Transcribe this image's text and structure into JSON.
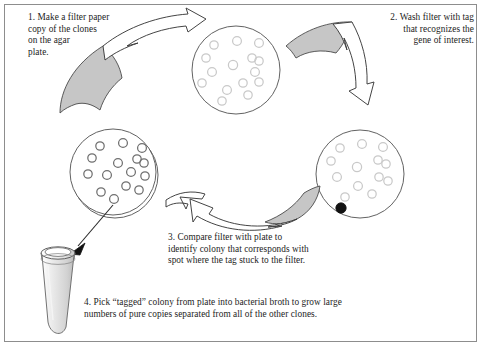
{
  "figure": {
    "frame_color": "#8d8d8d",
    "background": "#ffffff",
    "ink_color": "#2a2a2a",
    "filter_fill": "#c6c6c6",
    "colony_outline_light": "#c9c9c9",
    "colony_outline_dark": "#6f6f6f",
    "tagged_spot_color": "#111111"
  },
  "steps": [
    {
      "number": "1",
      "id": "step-1",
      "text": "1. Make a filter paper\ncopy of the clones\non the agar\nplate."
    },
    {
      "number": "2",
      "id": "step-2",
      "text": "2. Wash filter with tag\nthat recognizes the\ngene of interest."
    },
    {
      "number": "3",
      "id": "step-3",
      "text": "3. Compare filter with plate to\nidentify colony that corresponds with\nspot where the tag stuck to the filter."
    },
    {
      "number": "4",
      "id": "step-4",
      "text": "4. Pick “tagged” colony from plate into bacterial broth to grow large\nnumbers of pure copies separated from all of the other clones."
    }
  ],
  "dishes": [
    {
      "id": "filter-copy-top",
      "label": "filter paper copy with clone colonies",
      "cx": 236,
      "cy": 70,
      "r": 44,
      "double_ring": false,
      "colony_stroke": "#c9c9c9",
      "colonies": [
        {
          "x": 214,
          "y": 45,
          "r": 4.2
        },
        {
          "x": 237,
          "y": 41,
          "r": 4.4
        },
        {
          "x": 259,
          "y": 43,
          "r": 4.4
        },
        {
          "x": 206,
          "y": 58,
          "r": 4.2
        },
        {
          "x": 252,
          "y": 58,
          "r": 4.2
        },
        {
          "x": 259,
          "y": 61,
          "r": 4.2
        },
        {
          "x": 233,
          "y": 65,
          "r": 4.6
        },
        {
          "x": 212,
          "y": 72,
          "r": 4.4
        },
        {
          "x": 255,
          "y": 72,
          "r": 4.4
        },
        {
          "x": 202,
          "y": 83,
          "r": 4.2
        },
        {
          "x": 243,
          "y": 83,
          "r": 4.2
        },
        {
          "x": 259,
          "y": 82,
          "r": 4.2
        },
        {
          "x": 227,
          "y": 90,
          "r": 4.4
        },
        {
          "x": 248,
          "y": 95,
          "r": 4.2
        },
        {
          "x": 222,
          "y": 101,
          "r": 4.2
        }
      ],
      "tagged": null
    },
    {
      "id": "agar-plate-left",
      "label": "original agar plate with clone colonies",
      "cx": 113,
      "cy": 172,
      "r": 43,
      "double_ring": true,
      "colony_stroke": "#6f6f6f",
      "colonies": [
        {
          "x": 100,
          "y": 146,
          "r": 4.2
        },
        {
          "x": 123,
          "y": 143,
          "r": 4.4
        },
        {
          "x": 142,
          "y": 148,
          "r": 4.4
        },
        {
          "x": 92,
          "y": 158,
          "r": 4.2
        },
        {
          "x": 137,
          "y": 159,
          "r": 4.2
        },
        {
          "x": 144,
          "y": 163,
          "r": 4.2
        },
        {
          "x": 118,
          "y": 163,
          "r": 4.4
        },
        {
          "x": 131,
          "y": 172,
          "r": 4.4
        },
        {
          "x": 88,
          "y": 174,
          "r": 4.2
        },
        {
          "x": 107,
          "y": 175,
          "r": 4.4
        },
        {
          "x": 145,
          "y": 176,
          "r": 4.2
        },
        {
          "x": 126,
          "y": 186,
          "r": 4.2
        },
        {
          "x": 139,
          "y": 190,
          "r": 4.2
        },
        {
          "x": 101,
          "y": 192,
          "r": 4.2
        },
        {
          "x": 114,
          "y": 199,
          "r": 4.4
        }
      ],
      "tagged": null
    },
    {
      "id": "filter-tagged-right",
      "label": "washed filter showing tagged spot",
      "cx": 360,
      "cy": 174,
      "r": 44,
      "double_ring": false,
      "colony_stroke": "#c9c9c9",
      "colonies": [
        {
          "x": 340,
          "y": 148,
          "r": 4.2
        },
        {
          "x": 362,
          "y": 144,
          "r": 4.4
        },
        {
          "x": 383,
          "y": 147,
          "r": 4.4
        },
        {
          "x": 331,
          "y": 161,
          "r": 4.2
        },
        {
          "x": 378,
          "y": 160,
          "r": 4.2
        },
        {
          "x": 386,
          "y": 164,
          "r": 4.2
        },
        {
          "x": 357,
          "y": 167,
          "r": 4.6
        },
        {
          "x": 337,
          "y": 177,
          "r": 4.4
        },
        {
          "x": 379,
          "y": 177,
          "r": 4.2
        },
        {
          "x": 388,
          "y": 181,
          "r": 4.2
        },
        {
          "x": 358,
          "y": 186,
          "r": 4.4
        },
        {
          "x": 372,
          "y": 194,
          "r": 4.2
        },
        {
          "x": 345,
          "y": 197,
          "r": 4.2
        }
      ],
      "tagged": {
        "x": 341,
        "y": 208,
        "r": 5.2
      }
    }
  ],
  "filters": [
    {
      "id": "filter-wedge-left",
      "label": "filter paper peeling off plate"
    },
    {
      "id": "filter-wedge-right",
      "label": "filter paper being washed"
    },
    {
      "id": "filter-wedge-bottom",
      "label": "filter paper compared to plate"
    }
  ],
  "arrows": [
    {
      "id": "arrow-step-1",
      "label": "ribbon arrow from plate to filter copy",
      "direction": "up-right"
    },
    {
      "id": "arrow-step-2",
      "label": "ribbon arrow from filter to washing step",
      "direction": "down-right"
    },
    {
      "id": "arrow-step-3",
      "label": "ribbon arrow comparing filter back to plate",
      "direction": "left"
    },
    {
      "id": "arrow-step-4",
      "label": "straight arrow from colony to culture tube",
      "direction": "down-left"
    }
  ],
  "tube": {
    "id": "culture-tube",
    "label": "bacterial broth culture tube"
  }
}
